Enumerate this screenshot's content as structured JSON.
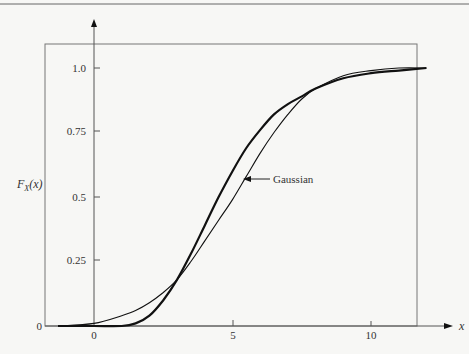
{
  "chart_data": {
    "type": "line",
    "title": "",
    "xlabel": "x",
    "ylabel": "F_X(x)",
    "xlim": [
      -1.4,
      12
    ],
    "ylim": [
      0,
      1.0
    ],
    "x_ticks": [
      "0",
      "5",
      "10"
    ],
    "y_ticks": [
      "0",
      "0.25",
      "0.5",
      "0.75",
      "1.0"
    ],
    "grid": false,
    "legend": null,
    "annotations": [
      {
        "text": "Gaussian",
        "points_to": "thin curve near x=5.3, y=0.55"
      }
    ],
    "series": [
      {
        "name": "F_X(x) (actual)",
        "style": "thick",
        "x": [
          -1.3,
          0,
          1,
          1.5,
          2,
          2.5,
          3,
          3.5,
          4,
          4.5,
          5,
          5.5,
          6,
          6.5,
          7,
          7.5,
          8,
          9,
          10,
          11,
          12
        ],
        "y": [
          0,
          0,
          0,
          0.01,
          0.04,
          0.1,
          0.18,
          0.28,
          0.39,
          0.5,
          0.6,
          0.69,
          0.76,
          0.82,
          0.86,
          0.89,
          0.92,
          0.96,
          0.98,
          0.99,
          1.0
        ]
      },
      {
        "name": "Gaussian",
        "style": "thin",
        "x": [
          -1.3,
          0,
          1,
          1.5,
          2,
          2.5,
          3,
          3.5,
          4,
          4.5,
          5,
          5.5,
          6,
          6.5,
          7,
          7.5,
          8,
          9,
          10,
          11,
          12
        ],
        "y": [
          0,
          0.01,
          0.04,
          0.06,
          0.09,
          0.13,
          0.18,
          0.25,
          0.33,
          0.41,
          0.49,
          0.58,
          0.67,
          0.75,
          0.82,
          0.88,
          0.92,
          0.97,
          0.99,
          1.0,
          1.0
        ]
      }
    ]
  },
  "labels": {
    "y_axis": "F",
    "y_axis_sub": "X",
    "y_axis_arg": "(x)",
    "x_axis": "x",
    "annotation": "Gaussian",
    "x_tick_0": "0",
    "x_tick_5": "5",
    "x_tick_10": "10",
    "y_tick_0": "0",
    "y_tick_025": "0.25",
    "y_tick_05": "0.5",
    "y_tick_075": "0.75",
    "y_tick_1": "1.0"
  }
}
